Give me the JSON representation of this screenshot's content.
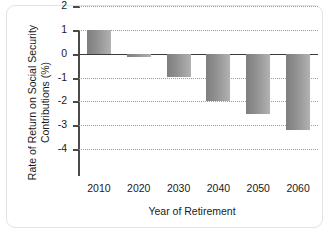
{
  "chart_data": {
    "type": "bar",
    "title": "",
    "xlabel": "Year of Retirement",
    "ylabel": "Rate of Return on Social Security Contributions (%)",
    "ylabel_line1": "Rate of Return on Social Security",
    "ylabel_line2": "Contributions (%)",
    "categories": [
      "2010",
      "2020",
      "2030",
      "2040",
      "2050",
      "2060"
    ],
    "values": [
      1.0,
      -0.15,
      -1.0,
      -2.0,
      -2.55,
      -3.2
    ],
    "ylim": [
      -4,
      2
    ],
    "yticks": [
      "2",
      "1",
      "0",
      "-1",
      "-2",
      "-3",
      "-4"
    ],
    "ytick_values": [
      2,
      1,
      0,
      -1,
      -2,
      -3,
      -4
    ],
    "grid": true,
    "grid_style": "dotted-horizontal",
    "legend": "none",
    "bar_color": "#8d8d8d",
    "axis_color": "#4a4a4a",
    "zero_line_color": "#3b3b3b",
    "background_color": "#ffffff",
    "frame_border_color": "#e3e3e3"
  }
}
